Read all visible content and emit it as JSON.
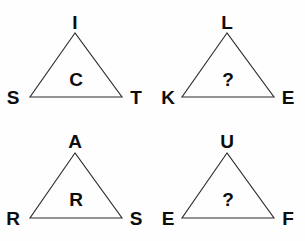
{
  "canvas": {
    "width": 305,
    "height": 241,
    "background_color": "#fefefe",
    "line_color": "#2a2a2a",
    "text_color": "#0d0d0d"
  },
  "puzzle": {
    "type": "letter-triangle-analogy",
    "triangles": [
      {
        "id": "triangle-1",
        "position": "top-left",
        "apex_label": "I",
        "left_label": "S",
        "right_label": "T",
        "center_label": "C",
        "is_question": false,
        "geometry": {
          "apex_x": 75,
          "apex_y": 33,
          "left_x": 30,
          "left_y": 97,
          "right_x": 122,
          "right_y": 97
        },
        "label_positions": {
          "apex": {
            "x": 75,
            "y": 13
          },
          "left": {
            "x": 13,
            "y": 88
          },
          "right": {
            "x": 136,
            "y": 88
          },
          "center": {
            "x": 76,
            "y": 70
          }
        }
      },
      {
        "id": "triangle-2",
        "position": "top-right",
        "apex_label": "L",
        "left_label": "K",
        "right_label": "E",
        "center_label": "?",
        "is_question": true,
        "geometry": {
          "apex_x": 227,
          "apex_y": 33,
          "left_x": 182,
          "left_y": 97,
          "right_x": 274,
          "right_y": 97
        },
        "label_positions": {
          "apex": {
            "x": 227,
            "y": 13
          },
          "left": {
            "x": 168,
            "y": 88
          },
          "right": {
            "x": 288,
            "y": 88
          },
          "center": {
            "x": 228,
            "y": 70
          }
        }
      },
      {
        "id": "triangle-3",
        "position": "bottom-left",
        "apex_label": "A",
        "left_label": "R",
        "right_label": "S",
        "center_label": "R",
        "is_question": false,
        "geometry": {
          "apex_x": 75,
          "apex_y": 153,
          "left_x": 30,
          "left_y": 218,
          "right_x": 122,
          "right_y": 218
        },
        "label_positions": {
          "apex": {
            "x": 75,
            "y": 132
          },
          "left": {
            "x": 13,
            "y": 209
          },
          "right": {
            "x": 136,
            "y": 209
          },
          "center": {
            "x": 76,
            "y": 190
          }
        }
      },
      {
        "id": "triangle-4",
        "position": "bottom-right",
        "apex_label": "U",
        "left_label": "E",
        "right_label": "F",
        "center_label": "?",
        "is_question": true,
        "geometry": {
          "apex_x": 227,
          "apex_y": 153,
          "left_x": 182,
          "left_y": 218,
          "right_x": 274,
          "right_y": 218
        },
        "label_positions": {
          "apex": {
            "x": 227,
            "y": 132
          },
          "left": {
            "x": 168,
            "y": 209
          },
          "right": {
            "x": 288,
            "y": 209
          },
          "center": {
            "x": 228,
            "y": 190
          }
        }
      }
    ]
  }
}
